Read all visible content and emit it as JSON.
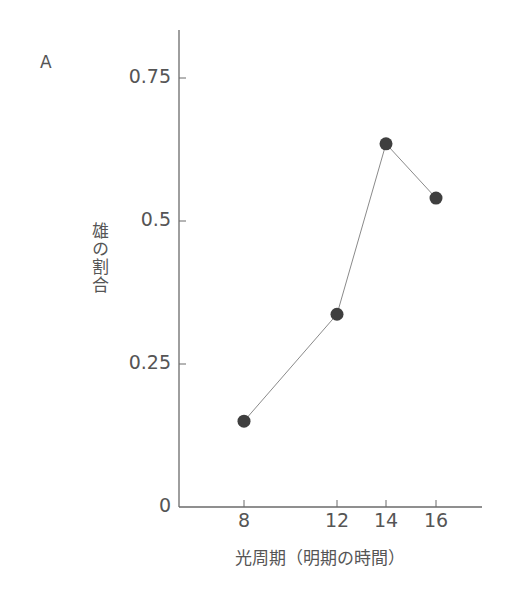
{
  "panel_label": "A",
  "chart_data": {
    "type": "line",
    "title": "",
    "xlabel": "光周期（明期の時間）",
    "ylabel": "雄の割合",
    "x": [
      8,
      12,
      14,
      16
    ],
    "series": [
      {
        "name": "雄の割合",
        "values": [
          0.15,
          0.337,
          0.635,
          0.54
        ]
      }
    ],
    "x_ticks": [
      "8",
      "12",
      "14",
      "16"
    ],
    "y_ticks": [
      "0",
      "0.25",
      "0.5",
      "0.75"
    ],
    "ylim": [
      0,
      0.84
    ],
    "xlim": [
      5.2,
      17.9
    ],
    "grid": false,
    "legend": "none",
    "marker": "filled-circle",
    "colors": {
      "marker": "#3f3f3f",
      "line": "#8a8a8a",
      "axis": "#6a6a6a",
      "text": "#555555"
    }
  }
}
